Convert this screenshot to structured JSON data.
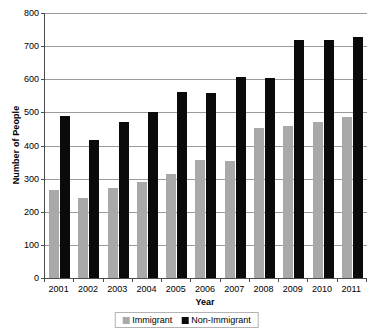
{
  "chart_data": {
    "type": "bar",
    "title": "",
    "xlabel": "Year",
    "ylabel": "Number of People",
    "categories": [
      "2001",
      "2002",
      "2003",
      "2004",
      "2005",
      "2006",
      "2007",
      "2008",
      "2009",
      "2010",
      "2011"
    ],
    "series": [
      {
        "name": "Immigrant",
        "color": "#a9a9a9",
        "values": [
          265,
          243,
          272,
          290,
          313,
          357,
          353,
          452,
          458,
          471,
          487
        ]
      },
      {
        "name": "Non-Immigrant",
        "color": "#0a0a0a",
        "values": [
          490,
          418,
          472,
          500,
          562,
          558,
          607,
          605,
          718,
          720,
          729
        ]
      }
    ],
    "ylim": [
      0,
      800
    ],
    "ytick_step": 100,
    "yticks": [
      "0",
      "100",
      "200",
      "300",
      "400",
      "500",
      "600",
      "700",
      "800"
    ],
    "grid": true,
    "legend_position": "bottom"
  },
  "legend": {
    "entries": [
      {
        "label": "Immigrant"
      },
      {
        "label": "Non-Immigrant"
      }
    ]
  }
}
